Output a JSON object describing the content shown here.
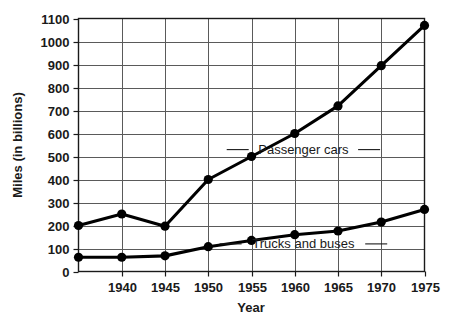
{
  "chart_data": {
    "type": "line",
    "title": "",
    "xlabel": "Year",
    "ylabel": "Miles (in billions)",
    "x": [
      1935,
      1940,
      1945,
      1950,
      1955,
      1960,
      1965,
      1970,
      1975
    ],
    "xticks": [
      "1940",
      "1945",
      "1950",
      "1955",
      "1960",
      "1965",
      "1970",
      "1975"
    ],
    "xtick_values": [
      1940,
      1945,
      1950,
      1955,
      1960,
      1965,
      1970,
      1975
    ],
    "yticks": [
      "0",
      "100",
      "200",
      "300",
      "400",
      "500",
      "600",
      "700",
      "800",
      "900",
      "1000",
      "1100"
    ],
    "ytick_values": [
      0,
      100,
      200,
      300,
      400,
      500,
      600,
      700,
      800,
      900,
      1000,
      1100
    ],
    "xlim": [
      1935,
      1975
    ],
    "ylim": [
      0,
      1100
    ],
    "grid": true,
    "legend_position": "inline-annotation",
    "series": [
      {
        "name": "Passenger cars",
        "label": "Passenger cars",
        "color": "#000000",
        "values": [
          200,
          250,
          197,
          400,
          500,
          600,
          720,
          895,
          1070
        ],
        "annotation_x": 1961,
        "annotation_y": 530
      },
      {
        "name": "Trucks and buses",
        "label": "Trucks and buses",
        "color": "#000000",
        "values": [
          62,
          62,
          68,
          108,
          135,
          160,
          176,
          215,
          270
        ],
        "annotation_x": 1961,
        "annotation_y": 120
      }
    ]
  },
  "colors": {
    "background": "#ffffff",
    "ink": "#1a1a1a",
    "grid": "#5a5a5a",
    "series": "#000000"
  }
}
